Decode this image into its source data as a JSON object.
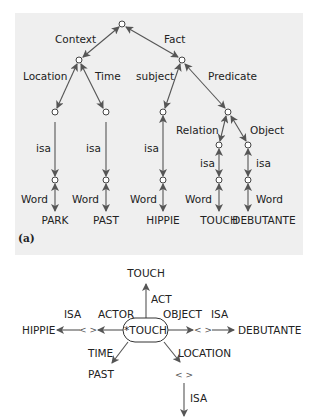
{
  "figure_a": {
    "label": "(a)",
    "background": "#efefef",
    "edge_labels": {
      "context": "Context",
      "fact": "Fact",
      "location": "Location",
      "time": "Time",
      "subject": "subject",
      "predicate": "Predicate",
      "relation": "Relation",
      "object": "Object",
      "isa": "isa",
      "word": "Word"
    },
    "leaves": [
      "PARK",
      "PAST",
      "HIPPIE",
      "TOUCH",
      "DEBUTANTE"
    ]
  },
  "figure_b": {
    "center": "*TOUCH",
    "act_target": "TOUCH",
    "act_label": "ACT",
    "actor_label": "ACTOR",
    "actor_isa_label": "ISA",
    "actor_target": "HIPPIE",
    "actor_placeholder": "< >",
    "object_label": "OBJECT",
    "object_isa_label": "ISA",
    "object_target": "DEBUTANTE",
    "object_placeholder": "< >",
    "time_label": "TIME",
    "time_target": "PAST",
    "location_label": "LOCATION",
    "location_placeholder": "< >",
    "location_isa_label": "ISA"
  }
}
